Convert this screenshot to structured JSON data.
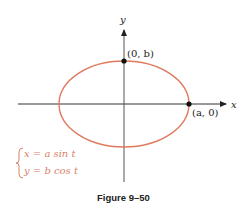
{
  "figure": {
    "caption": "Figure 9–50",
    "axes": {
      "x_label": "x",
      "y_label": "y"
    },
    "points": [
      {
        "label": "(0, b)"
      },
      {
        "label": "(a, 0)"
      }
    ],
    "equations": {
      "line1": "x = a sin t",
      "line2": "y = b cos t"
    },
    "colors": {
      "curve": "#e07a5f",
      "axes": "#333333",
      "equations": "#d9826a"
    }
  }
}
